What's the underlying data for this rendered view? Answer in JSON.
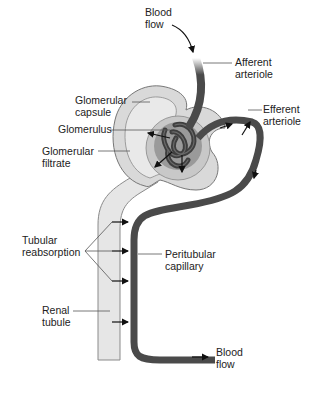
{
  "diagram": {
    "labels": {
      "blood_flow_in": [
        "Blood",
        "flow"
      ],
      "afferent_arteriole": [
        "Afferent",
        "arteriole"
      ],
      "efferent_arteriole": [
        "Efferent",
        "arteriole"
      ],
      "glomerular_capsule": [
        "Glomerular",
        "capsule"
      ],
      "glomerulus": [
        "Glomerulus"
      ],
      "glomerular_filtrate": [
        "Glomerular",
        "filtrate"
      ],
      "tubular_reabsorption": [
        "Tubular",
        "reabsorption"
      ],
      "peritubular_capillary": [
        "Peritubular",
        "capillary"
      ],
      "renal_tubule": [
        "Renal",
        "tubule"
      ],
      "blood_flow_out": [
        "Blood",
        "flow"
      ]
    },
    "colors": {
      "vessel": "#4a4a4a",
      "tubule_fill": "#e6e6e6",
      "tubule_edge": "#8a8a8a",
      "capsule_fill": "#d9d9d9",
      "glomerulus_bg": "#9a9a9a",
      "arrow": "#111111"
    }
  }
}
